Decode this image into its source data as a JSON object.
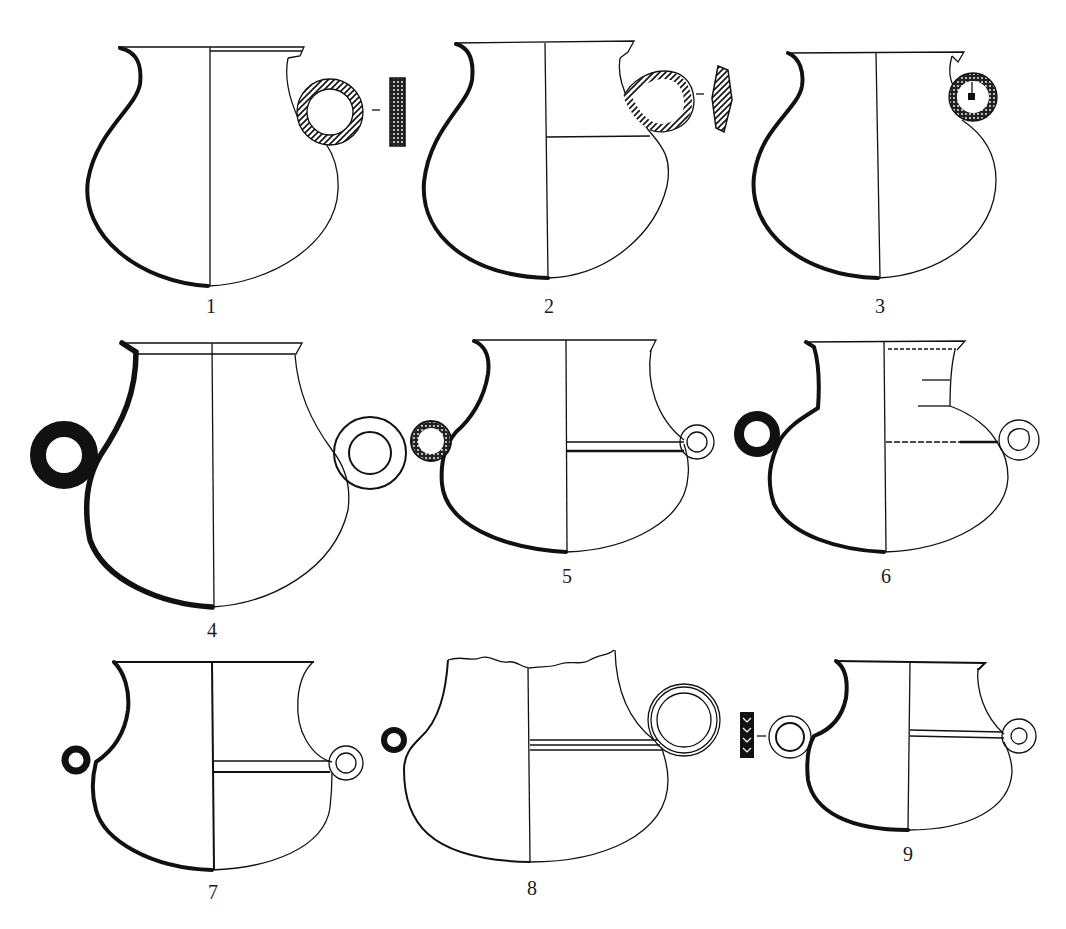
{
  "figure": {
    "type": "archaeological pottery plate",
    "background": "#ffffff",
    "ink": "#111111",
    "vessels": [
      {
        "label": "1",
        "form": "globular jar with single coiled/twisted ring handle on right",
        "handle_section": "rectangular hatched"
      },
      {
        "label": "2",
        "form": "globular jar with single twisted loop handle on right, horizontal section line",
        "handle_section": "lozenge hatched"
      },
      {
        "label": "3",
        "form": "globular jar with small coiled ring handle on right (dotted, with central square)"
      },
      {
        "label": "4",
        "form": "tall jar with two ring handles, left solid black, right double outlined ring"
      },
      {
        "label": "5",
        "form": "carinated jar with two small ring handles, left beaded, horizontal double band"
      },
      {
        "label": "6",
        "form": "jar with stepped neck, two ring handles, left solid black, dotted horizontal lines"
      },
      {
        "label": "7",
        "form": "squat jar with two small ring handles and horizontal double band"
      },
      {
        "label": "8",
        "form": "broken-rim jar with left small ring and right large double-ring handle"
      },
      {
        "label": "9",
        "form": "squat jar with two ring handles and horizontal band",
        "handle_section": "rectangular with chevron pattern"
      }
    ]
  }
}
